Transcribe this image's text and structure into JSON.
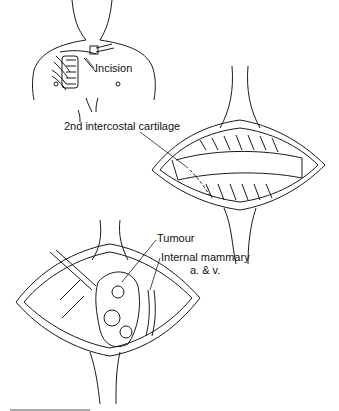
{
  "figure": {
    "panels": [
      {
        "id": "torso",
        "description": "Upper torso with incision site over right anterior chest"
      },
      {
        "id": "exposure",
        "description": "Retracted incision exposing 2nd intercostal cartilage"
      },
      {
        "id": "tumour",
        "description": "Opened chest wall revealing tumour and internal mammary vessels"
      }
    ],
    "labels": {
      "incision": "Incision",
      "cartilage": "2nd intercostal cartilage",
      "tumour": "Tumour",
      "mammary_line1": "Internal mammary",
      "mammary_line2": "a. & v."
    },
    "colors": {
      "ink": "#1a1a1a",
      "background": "#ffffff"
    }
  }
}
